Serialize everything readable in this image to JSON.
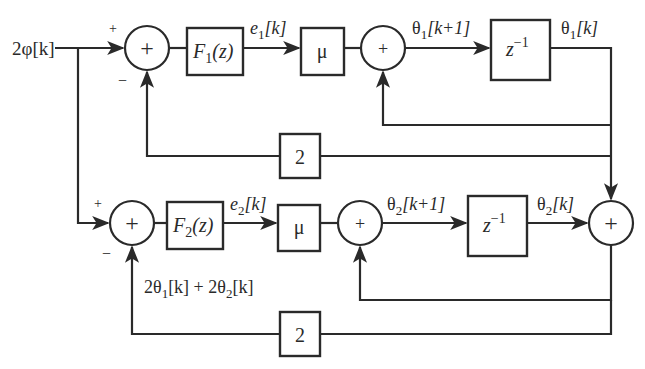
{
  "diagram": {
    "title": "",
    "input": {
      "label": "2φ[k]"
    },
    "branch_upper": {
      "sum1": {
        "symbol": "+",
        "plus_sign": "+",
        "minus_sign": "−"
      },
      "filter": {
        "name": "F",
        "sub": "1",
        "arg": "(z)"
      },
      "error": {
        "name": "e",
        "sub": "1",
        "arg": "[k]"
      },
      "gain": {
        "label": "μ"
      },
      "sum2": {
        "symbol": "+"
      },
      "next_state": {
        "name": "θ",
        "sub": "1",
        "arg": "[k+1]"
      },
      "delay": {
        "base": "z",
        "exp": "−1"
      },
      "state": {
        "name": "θ",
        "sub": "1",
        "arg": "[k]"
      },
      "feedback_gain": {
        "label": "2"
      }
    },
    "branch_lower": {
      "sum1": {
        "symbol": "+",
        "plus_sign": "+",
        "minus_sign": "−"
      },
      "filter": {
        "name": "F",
        "sub": "2",
        "arg": "(z)"
      },
      "error": {
        "name": "e",
        "sub": "2",
        "arg": "[k]"
      },
      "gain": {
        "label": "μ"
      },
      "sum2": {
        "symbol": "+"
      },
      "next_state": {
        "name": "θ",
        "sub": "2",
        "arg": "[k+1]"
      },
      "delay": {
        "base": "z",
        "exp": "−1"
      },
      "state": {
        "name": "θ",
        "sub": "2",
        "arg": "[k]"
      },
      "feedback_gain": {
        "label": "2"
      },
      "feedback_signal": {
        "p1": "2θ",
        "s1": "1",
        "a1": "[k] + 2θ",
        "s2": "2",
        "a2": "[k]"
      }
    },
    "output_sum": {
      "symbol": "+"
    }
  }
}
